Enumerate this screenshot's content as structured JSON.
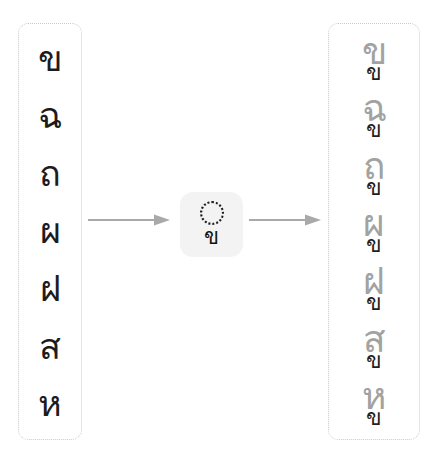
{
  "diagram": {
    "accent_color": "#9a9a9a",
    "chip_background": "#f3f3f3",
    "border_color": "#c9c9c9",
    "source_text_color": "#1c1c1c",
    "result_text_color": "#9a9a9a",
    "mark_text_color": "#1f1f1f"
  },
  "source_column": {
    "name": "source-characters",
    "items": [
      {
        "char": "ข"
      },
      {
        "char": "ฉ"
      },
      {
        "char": "ถ"
      },
      {
        "char": "ผ"
      },
      {
        "char": "ฝ"
      },
      {
        "char": "ส"
      },
      {
        "char": "ห"
      }
    ]
  },
  "transform": {
    "name": "subscript-rule",
    "placeholder_icon": "dotted-circle-icon",
    "mark": "ข",
    "arrow_left_icon": "arrow-right-icon",
    "arrow_right_icon": "arrow-right-icon"
  },
  "result_column": {
    "name": "composed-characters",
    "items": [
      {
        "base": "ข",
        "mark": "ข"
      },
      {
        "base": "ฉ",
        "mark": "ข"
      },
      {
        "base": "ถ",
        "mark": "ข"
      },
      {
        "base": "ผ",
        "mark": "ข"
      },
      {
        "base": "ฝ",
        "mark": "ข"
      },
      {
        "base": "ส",
        "mark": "ข"
      },
      {
        "base": "ห",
        "mark": "ข"
      }
    ]
  }
}
